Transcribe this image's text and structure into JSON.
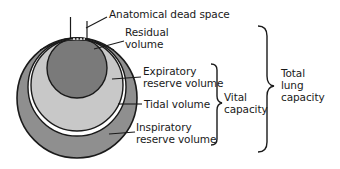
{
  "diagram": {
    "colors": {
      "inspiratory_reserve": "#8f8f8f",
      "tidal": "#ffffff",
      "expiratory_reserve": "#c8c8c8",
      "residual": "#7a7a7a",
      "outline": "#1a1a1a"
    },
    "labels": {
      "dead_space": "Anatomical dead space",
      "residual_1": "Residual",
      "residual_2": "volume",
      "erv_1": "Expiratory",
      "erv_2": "reserve volume",
      "tidal": "Tidal volume",
      "irv_1": "Inspiratory",
      "irv_2": "reserve volume",
      "vital_1": "Vital",
      "vital_2": "capacity",
      "total_1": "Total",
      "total_2": "lung",
      "total_3": "capacity"
    }
  }
}
